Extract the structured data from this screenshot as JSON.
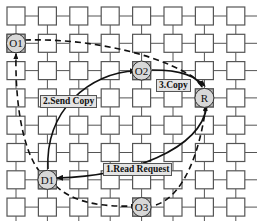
{
  "diagram": {
    "type": "mesh-network",
    "grid": {
      "cols": 8,
      "rows": 8,
      "x0": 7,
      "y0": 7,
      "pitch_x": 31.4,
      "pitch_y": 27.3,
      "box": 18
    },
    "colors": {
      "box_stroke": "#555555",
      "node_fill": "#d8d8d8",
      "arrow": "#111111",
      "label_bg": "#e4e4e4"
    },
    "nodes": [
      {
        "id": "O1",
        "label": "O1",
        "col": 0,
        "row": 1
      },
      {
        "id": "O2",
        "label": "O2",
        "col": 4,
        "row": 2
      },
      {
        "id": "R",
        "label": "R",
        "col": 6,
        "row": 3
      },
      {
        "id": "D1",
        "label": "D1",
        "col": 1,
        "row": 6
      },
      {
        "id": "O3",
        "label": "O3",
        "col": 4,
        "row": 7
      }
    ],
    "labels": {
      "read_request": "1.Read Request",
      "send_copy": "2.Send Copy",
      "copy": "3.Copy"
    },
    "edges": [
      {
        "from": "R",
        "to": "D1",
        "style": "solid",
        "label": "1.Read Request"
      },
      {
        "from": "D1",
        "to": "O2",
        "style": "solid",
        "label": "2.Send Copy"
      },
      {
        "from": "O2",
        "to": "R",
        "style": "solid",
        "label": "3.Copy"
      },
      {
        "from": "O1",
        "to": "R",
        "style": "dashed",
        "label": ""
      },
      {
        "from": "D1",
        "to": "O1",
        "style": "dashed",
        "label": ""
      },
      {
        "from": "D1",
        "to": "O3",
        "style": "dashed",
        "label": ""
      },
      {
        "from": "O3",
        "to": "R",
        "style": "dashed",
        "label": ""
      }
    ]
  }
}
